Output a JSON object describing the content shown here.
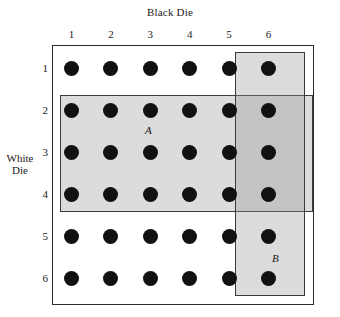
{
  "figure": {
    "x_axis_title": "Black Die",
    "y_axis_title_line1": "White",
    "y_axis_title_line2": "Die",
    "column_ticks": [
      "1",
      "2",
      "3",
      "4",
      "5",
      "6"
    ],
    "row_ticks": [
      "1",
      "2",
      "3",
      "4",
      "5",
      "6"
    ],
    "event_a_label": "A",
    "event_b_label": "B",
    "colors": {
      "dot": "#111111",
      "box_border": "#2b2b2b",
      "event_border": "#3a3a3a",
      "event_shade": "rgba(150,150,150,0.33)",
      "background": "#ffffff"
    }
  },
  "chart_data": {
    "type": "scatter",
    "title": "",
    "xlabel": "Black Die",
    "ylabel": "White Die",
    "x": [
      1,
      2,
      3,
      4,
      5,
      6
    ],
    "y": [
      1,
      2,
      3,
      4,
      5,
      6
    ],
    "xlim": [
      0.5,
      6.5
    ],
    "ylim": [
      0.5,
      6.5
    ],
    "grid": false,
    "legend": "none",
    "points": [
      {
        "x": 1,
        "y": 1
      },
      {
        "x": 2,
        "y": 1
      },
      {
        "x": 3,
        "y": 1
      },
      {
        "x": 4,
        "y": 1
      },
      {
        "x": 5,
        "y": 1
      },
      {
        "x": 6,
        "y": 1
      },
      {
        "x": 1,
        "y": 2
      },
      {
        "x": 2,
        "y": 2
      },
      {
        "x": 3,
        "y": 2
      },
      {
        "x": 4,
        "y": 2
      },
      {
        "x": 5,
        "y": 2
      },
      {
        "x": 6,
        "y": 2
      },
      {
        "x": 1,
        "y": 3
      },
      {
        "x": 2,
        "y": 3
      },
      {
        "x": 3,
        "y": 3
      },
      {
        "x": 4,
        "y": 3
      },
      {
        "x": 5,
        "y": 3
      },
      {
        "x": 6,
        "y": 3
      },
      {
        "x": 1,
        "y": 4
      },
      {
        "x": 2,
        "y": 4
      },
      {
        "x": 3,
        "y": 4
      },
      {
        "x": 4,
        "y": 4
      },
      {
        "x": 5,
        "y": 4
      },
      {
        "x": 6,
        "y": 4
      },
      {
        "x": 1,
        "y": 5
      },
      {
        "x": 2,
        "y": 5
      },
      {
        "x": 3,
        "y": 5
      },
      {
        "x": 4,
        "y": 5
      },
      {
        "x": 5,
        "y": 5
      },
      {
        "x": 6,
        "y": 5
      },
      {
        "x": 1,
        "y": 6
      },
      {
        "x": 2,
        "y": 6
      },
      {
        "x": 3,
        "y": 6
      },
      {
        "x": 4,
        "y": 6
      },
      {
        "x": 5,
        "y": 6
      },
      {
        "x": 6,
        "y": 6
      }
    ],
    "annotations": [
      {
        "label": "A",
        "description": "Event A: white die shows 2, 3 or 4 (rows 2-4, all black-die columns)",
        "x_range": [
          1,
          6
        ],
        "y_range": [
          2,
          4
        ],
        "count": 18
      },
      {
        "label": "B",
        "description": "Event B: black die shows 5 or 6 (columns 5-6, all white-die rows)",
        "x_range": [
          5,
          6
        ],
        "y_range": [
          1,
          6
        ],
        "count": 12
      }
    ],
    "total_outcomes": 36
  }
}
